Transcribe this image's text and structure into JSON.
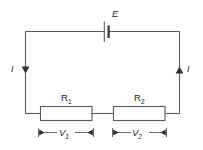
{
  "diagram": {
    "type": "circuit-schematic",
    "background_color": "#ffffff",
    "line_color": "#58585a",
    "text_color": "#1d1d1f"
  },
  "source": {
    "name": "battery",
    "symbol": "battery-cell",
    "label": "E",
    "label_style": "italic",
    "position": "top-center"
  },
  "current": {
    "left": {
      "label": "I",
      "direction": "down",
      "arrow": "down-arrow-icon"
    },
    "right": {
      "label": "I",
      "direction": "up",
      "arrow": "up-arrow-icon"
    }
  },
  "resistors": [
    {
      "label": "R",
      "subscript": "1",
      "position": "bottom-left"
    },
    {
      "label": "R",
      "subscript": "2",
      "position": "bottom-right"
    }
  ],
  "voltages": [
    {
      "label": "V",
      "subscript": "1",
      "across": "R1",
      "annotation": "double-arrow-dimension"
    },
    {
      "label": "V",
      "subscript": "2",
      "across": "R2",
      "annotation": "double-arrow-dimension"
    }
  ]
}
